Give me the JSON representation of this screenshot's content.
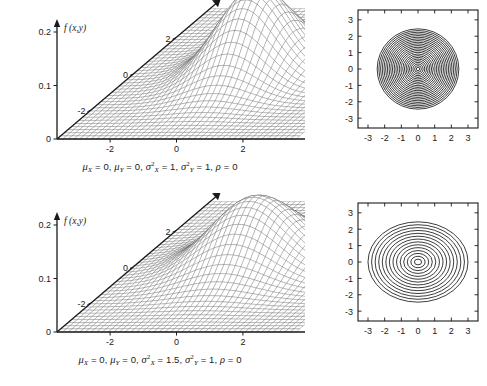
{
  "figure": {
    "background": "#ffffff",
    "ink_color": "#1a1a1a",
    "mesh_color": "#555555",
    "panels": [
      {
        "id": "panel-top",
        "caption": {
          "mu_x_label": "μ",
          "mu_x_sub": "X",
          "mu_x_value": "0",
          "mu_y_label": "μ",
          "mu_y_sub": "Y",
          "mu_y_value": "0",
          "sigma_x_label": "σ",
          "sigma_x_sub": "X",
          "sigma_x_sup": "2",
          "sigma_x_value": "1",
          "sigma_y_label": "σ",
          "sigma_y_sub": "Y",
          "sigma_y_sup": "2",
          "sigma_y_value": "1",
          "rho_label": "ρ",
          "rho_value": "0",
          "plain": "μX = 0, μY = 0, σX2 = 1, σY2 = 1, ρ = 0"
        },
        "surface": {
          "z_axis_label": "f (x,y)",
          "z_ticks": [
            "0",
            "0.1",
            "0.2"
          ],
          "z_tick_values": [
            0,
            0.1,
            0.2
          ],
          "x_axis_label": "x",
          "x_ticks": [
            "-2",
            "0",
            "2"
          ],
          "x_tick_values": [
            -2,
            0,
            2
          ],
          "y_axis_label": "y",
          "y_ticks": [
            "-2",
            "0",
            "2"
          ],
          "y_tick_values": [
            -2,
            0,
            2
          ]
        },
        "contour": {
          "x_ticks": [
            "-3",
            "-2",
            "-1",
            "0",
            "1",
            "2",
            "3"
          ],
          "x_tick_values": [
            -3,
            -2,
            -1,
            0,
            1,
            2,
            3
          ],
          "y_ticks": [
            "3",
            "2",
            "1",
            "0",
            "-1",
            "-2",
            "-3"
          ],
          "y_tick_values": [
            3,
            2,
            1,
            0,
            -1,
            -2,
            -3
          ],
          "xlim": [
            -3.6,
            3.6
          ],
          "ylim": [
            -3.6,
            3.6
          ],
          "n_levels": 24
        }
      },
      {
        "id": "panel-bottom",
        "caption": {
          "mu_x_label": "μ",
          "mu_x_sub": "X",
          "mu_x_value": "0",
          "mu_y_label": "μ",
          "mu_y_sub": "Y",
          "mu_y_value": "0",
          "sigma_x_label": "σ",
          "sigma_x_sub": "X",
          "sigma_x_sup": "2",
          "sigma_x_value": "1.5",
          "sigma_y_label": "σ",
          "sigma_y_sub": "Y",
          "sigma_y_sup": "2",
          "sigma_y_value": "1",
          "rho_label": "ρ",
          "rho_value": "0",
          "plain": "μX = 0, μY = 0, σX2 = 1.5, σY2 = 1, ρ = 0"
        },
        "surface": {
          "z_axis_label": "f (x,y)",
          "z_ticks": [
            "0",
            "0.1",
            "0.2"
          ],
          "z_tick_values": [
            0,
            0.1,
            0.2
          ],
          "x_axis_label": "x",
          "x_ticks": [
            "-2",
            "0",
            "2"
          ],
          "x_tick_values": [
            -2,
            0,
            2
          ],
          "y_axis_label": "y",
          "y_ticks": [
            "-2",
            "0",
            "2"
          ],
          "y_tick_values": [
            -2,
            0,
            2
          ]
        },
        "contour": {
          "x_ticks": [
            "-3",
            "-2",
            "-1",
            "0",
            "1",
            "2",
            "3"
          ],
          "x_tick_values": [
            -3,
            -2,
            -1,
            0,
            1,
            2,
            3
          ],
          "y_ticks": [
            "3",
            "2",
            "1",
            "0",
            "-1",
            "-2",
            "-3"
          ],
          "y_tick_values": [
            3,
            2,
            1,
            0,
            -1,
            -2,
            -3
          ],
          "xlim": [
            -3.6,
            3.6
          ],
          "ylim": [
            -3.6,
            3.6
          ],
          "n_levels": 14
        }
      }
    ]
  },
  "chart_data": [
    {
      "type": "surface",
      "title": "",
      "panel": "panel-top",
      "function": "bivariate-normal-pdf",
      "params": {
        "mu_x": 0,
        "mu_y": 0,
        "var_x": 1,
        "var_y": 1,
        "rho": 0
      },
      "xlabel": "x",
      "ylabel": "y",
      "zlabel": "f (x,y)",
      "xlim": [
        -3.6,
        3.6
      ],
      "ylim": [
        -3.6,
        3.6
      ],
      "zlim": [
        0,
        0.2
      ],
      "xticks": [
        -2,
        0,
        2
      ],
      "yticks": [
        -2,
        0,
        2
      ],
      "zticks": [
        0,
        0.1,
        0.2
      ],
      "peak_value": 0.159,
      "grid": true,
      "legend": "none"
    },
    {
      "type": "contour",
      "panel": "panel-top",
      "function": "bivariate-normal-pdf",
      "params": {
        "mu_x": 0,
        "mu_y": 0,
        "var_x": 1,
        "var_y": 1,
        "rho": 0
      },
      "xlabel": "",
      "ylabel": "",
      "xlim": [
        -3.6,
        3.6
      ],
      "ylim": [
        -3.6,
        3.6
      ],
      "xticks": [
        -3,
        -2,
        -1,
        0,
        1,
        2,
        3
      ],
      "yticks": [
        -3,
        -2,
        -1,
        0,
        1,
        2,
        3
      ],
      "n_levels": 24,
      "shape": "circular",
      "outermost_radius": 2.35,
      "grid": false,
      "legend": "none"
    },
    {
      "type": "surface",
      "panel": "panel-bottom",
      "function": "bivariate-normal-pdf",
      "params": {
        "mu_x": 0,
        "mu_y": 0,
        "var_x": 1.5,
        "var_y": 1,
        "rho": 0
      },
      "xlabel": "x",
      "ylabel": "y",
      "zlabel": "f (x,y)",
      "xlim": [
        -3.6,
        3.6
      ],
      "ylim": [
        -3.6,
        3.6
      ],
      "zlim": [
        0,
        0.2
      ],
      "xticks": [
        -2,
        0,
        2
      ],
      "yticks": [
        -2,
        0,
        2
      ],
      "zticks": [
        0,
        0.1,
        0.2
      ],
      "peak_value": 0.13,
      "grid": true,
      "legend": "none"
    },
    {
      "type": "contour",
      "panel": "panel-bottom",
      "function": "bivariate-normal-pdf",
      "params": {
        "mu_x": 0,
        "mu_y": 0,
        "var_x": 1.5,
        "var_y": 1,
        "rho": 0
      },
      "xlabel": "",
      "ylabel": "",
      "xlim": [
        -3.6,
        3.6
      ],
      "ylim": [
        -3.6,
        3.6
      ],
      "xticks": [
        -3,
        -2,
        -1,
        0,
        1,
        2,
        3
      ],
      "yticks": [
        -3,
        -2,
        -1,
        0,
        1,
        2,
        3
      ],
      "n_levels": 14,
      "shape": "elliptical-wide",
      "outermost_semi_axis_x": 2.6,
      "outermost_semi_axis_y": 2.1,
      "grid": false,
      "legend": "none"
    }
  ]
}
